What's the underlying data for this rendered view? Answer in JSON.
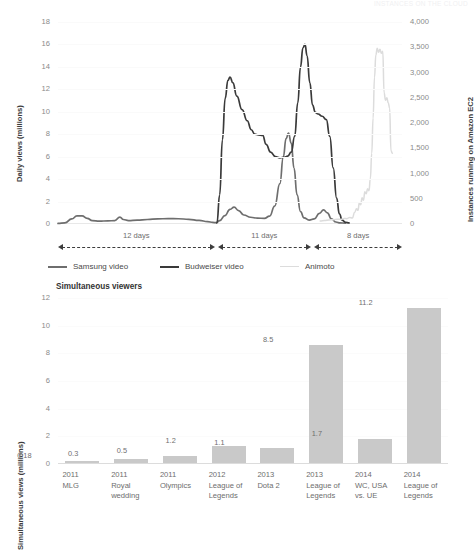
{
  "header": {
    "faint_text": "INSTANCES ON THE CLOUD"
  },
  "chart_data": [
    {
      "id": "daily-views-ec2",
      "type": "line",
      "title": "",
      "xlabel": "",
      "ylabel": "Daily views (millions)",
      "ylabel_right": "Instances running on Amazon EC2",
      "ylim": [
        0,
        18
      ],
      "ylim_right": [
        0,
        4000
      ],
      "yticks": [
        "0",
        "2",
        "4",
        "6",
        "8",
        "10",
        "12",
        "14",
        "16",
        "18"
      ],
      "yticks_right": [
        "0",
        "500",
        "1,000",
        "1,500",
        "2,000",
        "2,500",
        "3,000",
        "3,500",
        "4,000"
      ],
      "grid": true,
      "legend_position": "bottom",
      "legend": [
        "Samsung video",
        "Budweiser video",
        "Animoto"
      ],
      "span_annotations": [
        {
          "label": "12 days",
          "x_start": 0.0,
          "x_end": 0.455
        },
        {
          "label": "11 days",
          "x_start": 0.465,
          "x_end": 0.735
        },
        {
          "label": "8 days",
          "x_start": 0.745,
          "x_end": 1.0
        }
      ],
      "series": [
        {
          "name": "Samsung video",
          "color": "#6e6e6e",
          "axis": "left",
          "points": [
            [
              0.0,
              0.05
            ],
            [
              0.02,
              0.1
            ],
            [
              0.04,
              0.45
            ],
            [
              0.055,
              0.72
            ],
            [
              0.07,
              0.72
            ],
            [
              0.085,
              0.5
            ],
            [
              0.1,
              0.3
            ],
            [
              0.12,
              0.25
            ],
            [
              0.145,
              0.28
            ],
            [
              0.165,
              0.3
            ],
            [
              0.18,
              0.62
            ],
            [
              0.19,
              0.4
            ],
            [
              0.205,
              0.3
            ],
            [
              0.23,
              0.34
            ],
            [
              0.26,
              0.4
            ],
            [
              0.29,
              0.46
            ],
            [
              0.32,
              0.48
            ],
            [
              0.35,
              0.47
            ],
            [
              0.38,
              0.42
            ],
            [
              0.41,
              0.32
            ],
            [
              0.435,
              0.22
            ],
            [
              0.45,
              0.14
            ],
            [
              0.46,
              0.12
            ],
            [
              0.47,
              0.3
            ],
            [
              0.485,
              0.75
            ],
            [
              0.5,
              1.3
            ],
            [
              0.512,
              1.5
            ],
            [
              0.525,
              1.2
            ],
            [
              0.54,
              0.8
            ],
            [
              0.56,
              0.6
            ],
            [
              0.58,
              0.52
            ],
            [
              0.6,
              0.5
            ],
            [
              0.615,
              0.7
            ],
            [
              0.63,
              1.6
            ],
            [
              0.645,
              3.6
            ],
            [
              0.655,
              6.0
            ],
            [
              0.663,
              7.6
            ],
            [
              0.67,
              8.1
            ],
            [
              0.678,
              7.2
            ],
            [
              0.686,
              5.0
            ],
            [
              0.695,
              2.6
            ],
            [
              0.705,
              1.1
            ],
            [
              0.715,
              0.55
            ],
            [
              0.73,
              0.35
            ],
            [
              0.745,
              0.45
            ],
            [
              0.76,
              0.95
            ],
            [
              0.772,
              1.25
            ],
            [
              0.783,
              1.0
            ],
            [
              0.795,
              0.45
            ],
            [
              0.808,
              0.18
            ],
            [
              0.82,
              0.1
            ],
            [
              0.835,
              0.08
            ]
          ]
        },
        {
          "name": "Budweiser video",
          "color": "#3a3a3a",
          "axis": "left",
          "points": [
            [
              0.462,
              0.1
            ],
            [
              0.47,
              2.6
            ],
            [
              0.478,
              7.5
            ],
            [
              0.486,
              11.2
            ],
            [
              0.494,
              12.8
            ],
            [
              0.5,
              13.1
            ],
            [
              0.508,
              12.6
            ],
            [
              0.52,
              11.4
            ],
            [
              0.535,
              10.2
            ],
            [
              0.55,
              9.2
            ],
            [
              0.562,
              8.4
            ],
            [
              0.572,
              8.0
            ],
            [
              0.582,
              7.95
            ],
            [
              0.595,
              7.9
            ],
            [
              0.605,
              7.1
            ],
            [
              0.618,
              6.4
            ],
            [
              0.632,
              6.0
            ],
            [
              0.645,
              5.9
            ],
            [
              0.658,
              5.95
            ],
            [
              0.668,
              6.05
            ],
            [
              0.678,
              6.4
            ],
            [
              0.688,
              7.8
            ],
            [
              0.697,
              10.8
            ],
            [
              0.705,
              14.0
            ],
            [
              0.712,
              15.7
            ],
            [
              0.718,
              16.0
            ],
            [
              0.724,
              15.0
            ],
            [
              0.732,
              12.6
            ],
            [
              0.74,
              10.6
            ],
            [
              0.748,
              9.95
            ],
            [
              0.756,
              9.8
            ],
            [
              0.768,
              9.6
            ],
            [
              0.78,
              9.3
            ],
            [
              0.79,
              7.8
            ],
            [
              0.8,
              5.0
            ],
            [
              0.81,
              2.3
            ],
            [
              0.818,
              0.9
            ],
            [
              0.826,
              0.35
            ],
            [
              0.836,
              0.15
            ],
            [
              0.846,
              0.1
            ]
          ]
        },
        {
          "name": "Animoto",
          "color": "#dcdcdc",
          "axis": "right",
          "points": [
            [
              0.762,
              60
            ],
            [
              0.775,
              70
            ],
            [
              0.788,
              80
            ],
            [
              0.8,
              85
            ],
            [
              0.812,
              95
            ],
            [
              0.822,
              90
            ],
            [
              0.832,
              110
            ],
            [
              0.84,
              105
            ],
            [
              0.848,
              130
            ],
            [
              0.856,
              120
            ],
            [
              0.862,
              230
            ],
            [
              0.868,
              300
            ],
            [
              0.872,
              270
            ],
            [
              0.876,
              420
            ],
            [
              0.88,
              380
            ],
            [
              0.884,
              520
            ],
            [
              0.888,
              470
            ],
            [
              0.892,
              640
            ],
            [
              0.896,
              600
            ],
            [
              0.9,
              700
            ],
            [
              0.904,
              660
            ],
            [
              0.908,
              900
            ],
            [
              0.912,
              1400
            ],
            [
              0.916,
              2100
            ],
            [
              0.92,
              2900
            ],
            [
              0.924,
              3350
            ],
            [
              0.928,
              3480
            ],
            [
              0.932,
              3400
            ],
            [
              0.936,
              3460
            ],
            [
              0.94,
              3380
            ],
            [
              0.944,
              3420
            ],
            [
              0.948,
              2600
            ],
            [
              0.952,
              2450
            ],
            [
              0.956,
              2500
            ],
            [
              0.96,
              2400
            ],
            [
              0.964,
              2300
            ],
            [
              0.968,
              1450
            ],
            [
              0.972,
              1400
            ]
          ]
        }
      ]
    },
    {
      "id": "simultaneous-viewers",
      "type": "bar",
      "title": "Simultaneous viewers",
      "xlabel": "",
      "ylabel": "Simultaneous views (millions)",
      "ylim": [
        0,
        12
      ],
      "yticks": [
        "0",
        "2",
        "4",
        "6",
        "8",
        "10",
        "12"
      ],
      "grid": true,
      "bar_color": "#c9c9c9",
      "categories": [
        "2011\nMLG",
        "2011\nRoyal\nwedding",
        "2011\nOlympics",
        "2012\nLeague of\nLegends",
        "2013\nDota 2",
        "2013\nLeague of\nLegends",
        "2014\nWC, USA\nvs. UE",
        "2014\nLeague of\nLegends"
      ],
      "values": [
        0.18,
        0.3,
        0.5,
        1.2,
        1.1,
        8.5,
        1.7,
        11.2
      ],
      "value_labels": [
        "0.18",
        "0.3",
        "0.5",
        "1.2",
        "1.1",
        "8.5",
        "1.7",
        "11.2"
      ]
    }
  ]
}
